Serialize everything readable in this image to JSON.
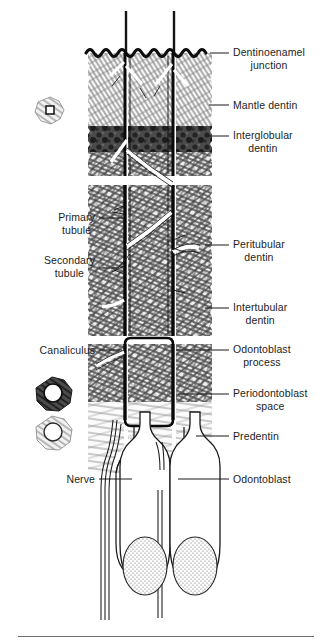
{
  "figure": {
    "background": "#ffffff",
    "ink": "#1b1b1b",
    "rule_color": "#6d6d6d"
  },
  "labels_right": [
    {
      "id": "dentinoenamel-junction",
      "line1": "Dentinoenamel",
      "line2": "junction",
      "leader_y": 53,
      "text_x": 233,
      "text_y": 46,
      "leader_x1": 210,
      "leader_x2": 229
    },
    {
      "id": "mantle-dentin",
      "line1": "Mantle dentin",
      "line2": "",
      "leader_y": 105,
      "text_x": 233,
      "text_y": 99,
      "leader_x1": 209,
      "leader_x2": 229
    },
    {
      "id": "interglobular-dentin",
      "line1": "Interglobular",
      "line2": "dentin",
      "leader_y": 136,
      "text_x": 233,
      "text_y": 129,
      "leader_x1": 207,
      "leader_x2": 229
    },
    {
      "id": "peritubular-dentin",
      "line1": "Peritubular",
      "line2": "dentin",
      "leader_y": 245,
      "text_x": 233,
      "text_y": 238,
      "leader_x1": 205,
      "leader_x2": 229
    },
    {
      "id": "intertubular-dentin",
      "line1": "Intertubular",
      "line2": "dentin",
      "leader_y": 308,
      "text_x": 233,
      "text_y": 301,
      "leader_x1": 205,
      "leader_x2": 229
    },
    {
      "id": "odontoblast-process",
      "line1": "Odontoblast",
      "line2": "process",
      "leader_y": 350,
      "text_x": 233,
      "text_y": 343,
      "leader_x1": 176,
      "leader_x2": 229
    },
    {
      "id": "periodontoblast-space",
      "line1": "Periodontoblast",
      "line2": "space",
      "leader_y": 394,
      "text_x": 233,
      "text_y": 387,
      "leader_x1": 178,
      "leader_x2": 229
    },
    {
      "id": "predentin",
      "line1": "Predentin",
      "line2": "",
      "leader_y": 436,
      "text_x": 233,
      "text_y": 430,
      "leader_x1": 196,
      "leader_x2": 229
    },
    {
      "id": "odontoblast",
      "line1": "Odontoblast",
      "line2": "",
      "leader_y": 479,
      "text_x": 233,
      "text_y": 473,
      "leader_x1": 178,
      "leader_x2": 229
    }
  ],
  "labels_left": [
    {
      "id": "primary-tubule",
      "line1": "Primary",
      "line2": "tubule",
      "leader_y": 218,
      "text_right": 95,
      "text_y": 211,
      "leader_x1": 99,
      "leader_x2": 124
    },
    {
      "id": "secondary-tubule",
      "line1": "Secondary",
      "line2": "tubule",
      "leader_y": 261,
      "text_right": 95,
      "text_y": 254,
      "leader_x1": 99,
      "leader_x2": 125,
      "leader_y2": 277
    },
    {
      "id": "canaliculus",
      "line1": "Canaliculus",
      "line2": "",
      "leader_y": 350,
      "text_right": 95,
      "text_y": 344,
      "leader_x1": 99,
      "leader_x2": 122
    },
    {
      "id": "nerve",
      "line1": "Nerve",
      "line2": "",
      "leader_y": 479,
      "text_right": 95,
      "text_y": 473,
      "leader_x1": 99,
      "leader_x2": 130
    }
  ],
  "insets": [
    {
      "id": "tubule-cross-section-top",
      "cx": 50,
      "cy": 110,
      "r": 13,
      "shade": "light"
    },
    {
      "id": "tubule-cross-section-dark",
      "cx": 52,
      "cy": 393,
      "r": 15,
      "shade": "dark"
    },
    {
      "id": "tubule-cross-section-light",
      "cx": 52,
      "cy": 432,
      "r": 15,
      "shade": "light"
    }
  ],
  "structure": {
    "column_left": {
      "x": 88,
      "width": 34
    },
    "column_mid": {
      "x": 128,
      "width": 42
    },
    "column_right": {
      "x": 176,
      "width": 34
    },
    "tubule_wall_left_x": 124,
    "tubule_wall_right_x": 172,
    "dej_y": 53,
    "mantle_band": [
      53,
      126
    ],
    "interglobular_band": [
      126,
      152
    ],
    "circumpulpal_band": [
      152,
      420
    ],
    "predentin_band": [
      400,
      470
    ],
    "odontoblast_band": [
      470,
      620
    ],
    "nuclei": [
      {
        "cx": 142,
        "cy": 565,
        "rx": 22,
        "ry": 29
      },
      {
        "cx": 192,
        "cy": 565,
        "rx": 22,
        "ry": 29
      }
    ]
  }
}
